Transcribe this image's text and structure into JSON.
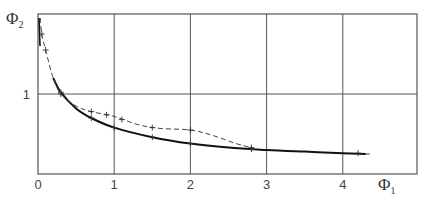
{
  "chart_data": {
    "type": "line",
    "title": "",
    "xlabel": "Φ1",
    "ylabel": "Φ2",
    "xlabel_main": "Φ",
    "xlabel_sub": "1",
    "ylabel_main": "Φ",
    "ylabel_sub": "2",
    "xlim": [
      0,
      5
    ],
    "ylim": [
      0,
      2
    ],
    "grid": true,
    "x_ticks": [
      "0",
      "1",
      "2",
      "3",
      "4"
    ],
    "y_ticks": [
      "1"
    ],
    "legend": null,
    "series": [
      {
        "name": "solid",
        "style": "solid",
        "x": [
          0.2,
          0.3,
          0.5,
          0.7,
          1.0,
          1.5,
          2.0,
          2.5,
          3.0,
          3.5,
          4.0,
          4.3
        ],
        "y": [
          1.2,
          1.02,
          0.82,
          0.7,
          0.58,
          0.46,
          0.38,
          0.33,
          0.3,
          0.28,
          0.26,
          0.25
        ]
      },
      {
        "name": "dashed",
        "style": "dashed",
        "x": [
          0.03,
          0.05,
          0.1,
          0.2,
          0.3,
          0.5,
          0.7,
          1.0,
          1.3,
          1.6,
          2.0,
          2.3,
          2.6,
          2.8
        ],
        "y": [
          1.95,
          1.75,
          1.55,
          1.2,
          1.0,
          0.85,
          0.78,
          0.72,
          0.62,
          0.57,
          0.55,
          0.48,
          0.38,
          0.33
        ]
      }
    ],
    "markers": {
      "solid": [
        [
          0.3,
          1.02
        ],
        [
          0.7,
          0.7
        ],
        [
          1.0,
          0.58
        ],
        [
          1.5,
          0.46
        ],
        [
          2.0,
          0.38
        ],
        [
          2.8,
          0.31
        ],
        [
          4.2,
          0.26
        ]
      ],
      "dashed": [
        [
          0.05,
          1.75
        ],
        [
          0.1,
          1.55
        ],
        [
          0.3,
          1.0
        ],
        [
          0.7,
          0.78
        ],
        [
          0.9,
          0.74
        ],
        [
          1.1,
          0.68
        ],
        [
          1.5,
          0.58
        ],
        [
          2.0,
          0.55
        ],
        [
          2.8,
          0.33
        ]
      ]
    }
  }
}
